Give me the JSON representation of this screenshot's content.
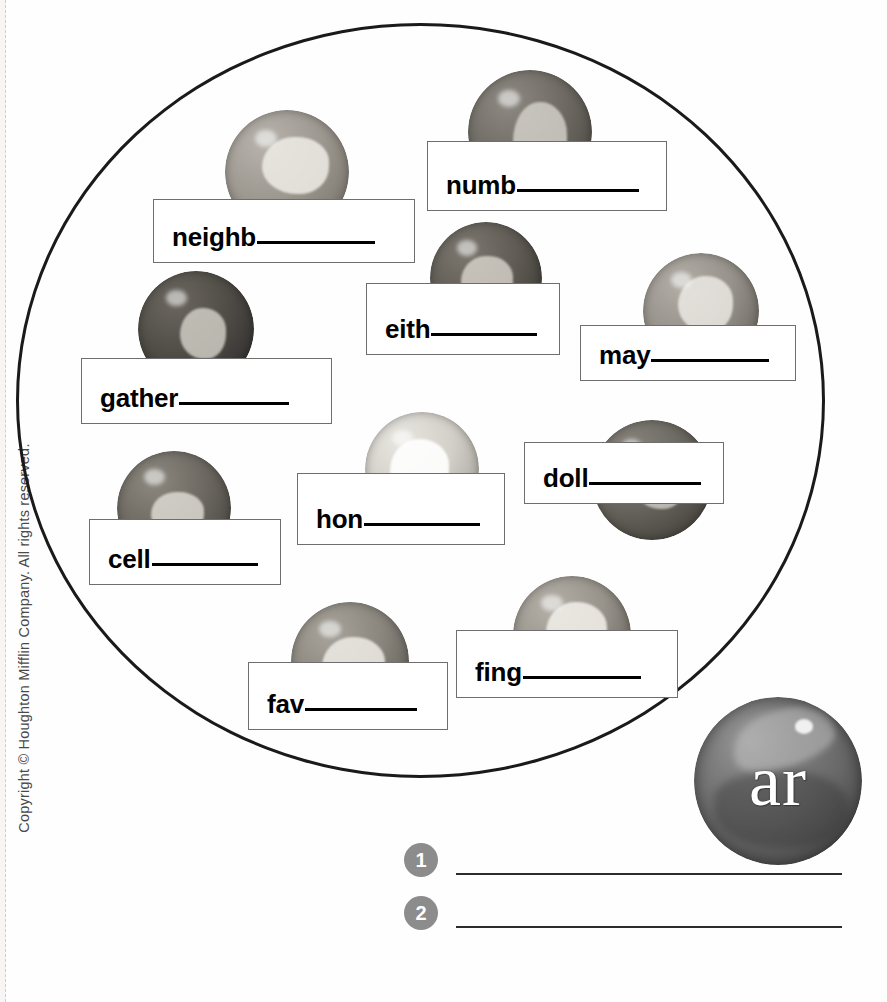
{
  "page": {
    "copyright": "Copyright © Houghton Mifflin Company. All rights reserved."
  },
  "sorting_circle": {
    "label": "word-sort-circle"
  },
  "key_marble": {
    "label": "ar"
  },
  "word_boxes": [
    {
      "id": "neighb",
      "stem": "neighb",
      "blank": "__________",
      "left": 153,
      "top": 199,
      "width": 262,
      "height": 64,
      "blank_width": 118
    },
    {
      "id": "numb",
      "stem": "numb",
      "blank": "__________",
      "left": 427,
      "top": 141,
      "width": 240,
      "height": 70,
      "blank_width": 122
    },
    {
      "id": "eith",
      "stem": "eith",
      "blank": "__________",
      "left": 366,
      "top": 283,
      "width": 194,
      "height": 72,
      "blank_width": 106
    },
    {
      "id": "may",
      "stem": "may",
      "blank": "__________",
      "left": 580,
      "top": 325,
      "width": 216,
      "height": 56,
      "blank_width": 118
    },
    {
      "id": "gather",
      "stem": "gather",
      "blank": "__________",
      "left": 81,
      "top": 358,
      "width": 251,
      "height": 66,
      "blank_width": 110
    },
    {
      "id": "hon",
      "stem": "hon",
      "blank": "__________",
      "left": 297,
      "top": 473,
      "width": 208,
      "height": 72,
      "blank_width": 116
    },
    {
      "id": "doll",
      "stem": "doll",
      "blank": "__________",
      "left": 524,
      "top": 442,
      "width": 200,
      "height": 62,
      "blank_width": 112
    },
    {
      "id": "cell",
      "stem": "cell",
      "blank": "__________",
      "left": 89,
      "top": 519,
      "width": 192,
      "height": 66,
      "blank_width": 106
    },
    {
      "id": "fav",
      "stem": "fav",
      "blank": "__________",
      "left": 248,
      "top": 662,
      "width": 200,
      "height": 68,
      "blank_width": 112
    },
    {
      "id": "fing",
      "stem": "fing",
      "blank": "__________",
      "left": 456,
      "top": 630,
      "width": 222,
      "height": 68,
      "blank_width": 118
    }
  ],
  "marbles": [
    {
      "id": "marble-neighb",
      "left": 225,
      "top": 110,
      "size": 124,
      "base": "#b8b4ad",
      "mid": "#9d9890",
      "dark": "#7d786f",
      "swirl": "rgba(238,236,230,.85)",
      "sx": 30,
      "sy": 22,
      "sw": 54,
      "sh": 46
    },
    {
      "id": "marble-numb",
      "left": 468,
      "top": 70,
      "size": 124,
      "base": "#8e8a83",
      "mid": "#6f6b64",
      "dark": "#4f4c46",
      "swirl": "rgba(215,212,205,.8)",
      "sx": 36,
      "sy": 26,
      "sw": 44,
      "sh": 60
    },
    {
      "id": "marble-eith",
      "left": 430,
      "top": 222,
      "size": 112,
      "base": "#7c776f",
      "mid": "#605c55",
      "dark": "#3f3c37",
      "swirl": "rgba(225,222,214,.75)",
      "sx": 28,
      "sy": 30,
      "sw": 46,
      "sh": 44
    },
    {
      "id": "marble-may",
      "left": 643,
      "top": 253,
      "size": 116,
      "base": "#b2aea6",
      "mid": "#96918a",
      "dark": "#6d6962",
      "swirl": "rgba(240,238,232,.8)",
      "sx": 30,
      "sy": 20,
      "sw": 48,
      "sh": 48
    },
    {
      "id": "marble-gather",
      "left": 138,
      "top": 271,
      "size": 116,
      "base": "#6b6760",
      "mid": "#504d47",
      "dark": "#343230",
      "swirl": "rgba(214,211,203,.8)",
      "sx": 36,
      "sy": 32,
      "sw": 40,
      "sh": 44
    },
    {
      "id": "marble-cell",
      "left": 117,
      "top": 451,
      "size": 114,
      "base": "#8c887f",
      "mid": "#6d6962",
      "dark": "#4b4843",
      "swirl": "rgba(226,224,216,.8)",
      "sx": 30,
      "sy": 36,
      "sw": 46,
      "sh": 38
    },
    {
      "id": "marble-hon",
      "left": 365,
      "top": 412,
      "size": 114,
      "base": "#e8e6e0",
      "mid": "#d2cfc8",
      "dark": "#a9a59d",
      "swirl": "rgba(255,255,255,.9)",
      "sx": 22,
      "sy": 24,
      "sw": 52,
      "sh": 52
    },
    {
      "id": "marble-doll",
      "left": 592,
      "top": 420,
      "size": 120,
      "base": "#8a867e",
      "mid": "#6a6760",
      "dark": "#49463f",
      "swirl": "rgba(224,221,213,.7)",
      "sx": 34,
      "sy": 28,
      "sw": 44,
      "sh": 46
    },
    {
      "id": "marble-fav",
      "left": 291,
      "top": 602,
      "size": 118,
      "base": "#a8a49c",
      "mid": "#8a867e",
      "dark": "#625f58",
      "swirl": "rgba(238,236,230,.85)",
      "sx": 26,
      "sy": 30,
      "sw": 54,
      "sh": 48
    },
    {
      "id": "marble-fing",
      "left": 513,
      "top": 576,
      "size": 118,
      "base": "#b4b0a8",
      "mid": "#97928a",
      "dark": "#6b6760",
      "swirl": "rgba(243,241,235,.85)",
      "sx": 28,
      "sy": 22,
      "sw": 52,
      "sh": 50
    }
  ],
  "answer_lines": [
    {
      "number": "1",
      "left": 404,
      "top": 843,
      "rule_width": 386
    },
    {
      "number": "2",
      "left": 404,
      "top": 896,
      "rule_width": 386
    }
  ]
}
